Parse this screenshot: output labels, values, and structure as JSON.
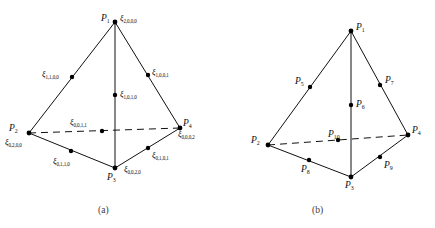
{
  "figure": {
    "panels": [
      {
        "id": "panel-a",
        "caption": "(a)",
        "vertices": [
          {
            "name": "P1",
            "base": "P",
            "sub": "1"
          },
          {
            "name": "P2",
            "base": "P",
            "sub": "2"
          },
          {
            "name": "P3",
            "base": "P",
            "sub": "3"
          },
          {
            "name": "P4",
            "base": "P",
            "sub": "4"
          }
        ],
        "nodes": [
          {
            "name": "xi-2000",
            "base": "ξ",
            "sub": "2,0,0,0"
          },
          {
            "name": "xi-1100",
            "base": "ξ",
            "sub": "1,1,0,0"
          },
          {
            "name": "xi-1001",
            "base": "ξ",
            "sub": "1,0,0,1"
          },
          {
            "name": "xi-1010",
            "base": "ξ",
            "sub": "1,0,1,0"
          },
          {
            "name": "xi-0011",
            "base": "ξ",
            "sub": "0,0,1,1"
          },
          {
            "name": "xi-0200",
            "base": "ξ",
            "sub": "0,2,0,0"
          },
          {
            "name": "xi-0110",
            "base": "ξ",
            "sub": "0,1,1,0"
          },
          {
            "name": "xi-0020",
            "base": "ξ",
            "sub": "0,0,2,0"
          },
          {
            "name": "xi-0101",
            "base": "ξ",
            "sub": "0,1,0,1"
          },
          {
            "name": "xi-0002",
            "base": "ξ",
            "sub": "0,0,0,2"
          }
        ]
      },
      {
        "id": "panel-b",
        "caption": "(b)",
        "nodes": [
          {
            "name": "P1",
            "base": "P",
            "sub": "1"
          },
          {
            "name": "P2",
            "base": "P",
            "sub": "2"
          },
          {
            "name": "P3",
            "base": "P",
            "sub": "3"
          },
          {
            "name": "P4",
            "base": "P",
            "sub": "4"
          },
          {
            "name": "P5",
            "base": "P",
            "sub": "5"
          },
          {
            "name": "P6",
            "base": "P",
            "sub": "6"
          },
          {
            "name": "P7",
            "base": "P",
            "sub": "7"
          },
          {
            "name": "P8",
            "base": "P",
            "sub": "8"
          },
          {
            "name": "P9",
            "base": "P",
            "sub": "9"
          },
          {
            "name": "P10",
            "base": "P",
            "sub": "10"
          }
        ]
      }
    ],
    "colors": {
      "line": "#111111",
      "dot": "#000000",
      "background": "#ffffff",
      "caption": "#3a3a3a"
    }
  }
}
